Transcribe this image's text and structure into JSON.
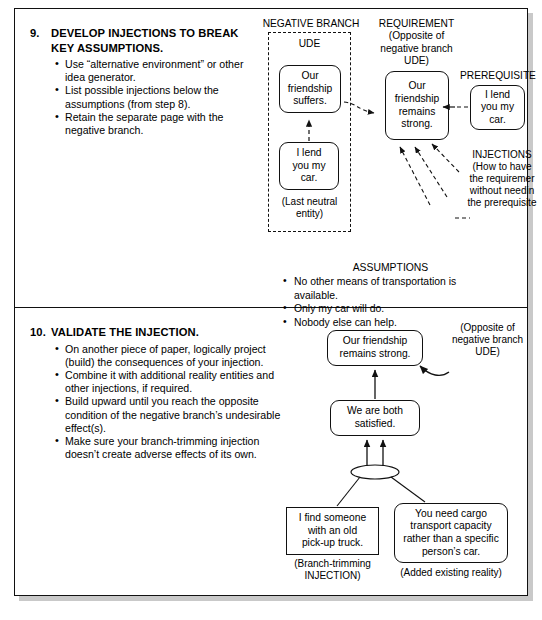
{
  "page": {
    "steps": [
      {
        "number": "9.",
        "title": "DEVELOP INJECTIONS TO BREAK\nKEY ASSUMPTIONS.",
        "bullets": [
          "Use “alternative environment” or other idea generator.",
          "List possible injections below the assumptions (from step 8).",
          "Retain the separate page with the negative branch."
        ]
      },
      {
        "number": "10.",
        "title": "VALIDATE THE INJECTION.",
        "bullets": [
          "On another piece of paper, logically project (build) the consequences of your injection.",
          "Combine it with additional reality entities and other injections, if required.",
          "Build upward until you reach the opposite condition of the negative branch’s undesirable effect(s).",
          "Make sure your branch-trimming injection doesn’t create adverse effects of its own."
        ]
      }
    ]
  },
  "diagram_top": {
    "negative_branch_label": "NEGATIVE BRANCH",
    "ude_label": "UDE",
    "ude_box": "Our\nfriendship\nsuffers.",
    "neutral_box": "I lend\nyou my\ncar.",
    "last_neutral_caption": "(Last neutral\nentity)",
    "requirement_label": "REQUIREMENT\n(Opposite of\nnegative branch\nUDE)",
    "requirement_box": "Our\nfriendship\nremains\nstrong.",
    "prerequisite_label": "PREREQUISITE",
    "prerequisite_box": "I lend\nyou my\ncar.",
    "injections_label": "INJECTIONS\n(How to have\nthe requiremer\nwithout needin\nthe prerequisite"
  },
  "assumptions": {
    "title": "ASSUMPTIONS",
    "items": [
      "No other means of transportation is available.",
      "Only my car will do.",
      "Nobody else can help."
    ]
  },
  "diagram_bottom": {
    "top_box": "Our friendship\nremains strong.",
    "opposite_caption": "(Opposite of\nnegative branch\nUDE)",
    "middle_box": "We are both\nsatisfied.",
    "left_box": "I find someone\nwith an old\npick-up truck.",
    "left_caption": "(Branch-trimming\nINJECTION)",
    "right_box": "You need cargo\ntransport capacity\nrather than a specific\nperson’s car.",
    "right_caption": "(Added existing reality)"
  },
  "colors": {
    "ink": "#111111",
    "paper": "#ffffff",
    "shadow": "#c9c9c9"
  }
}
